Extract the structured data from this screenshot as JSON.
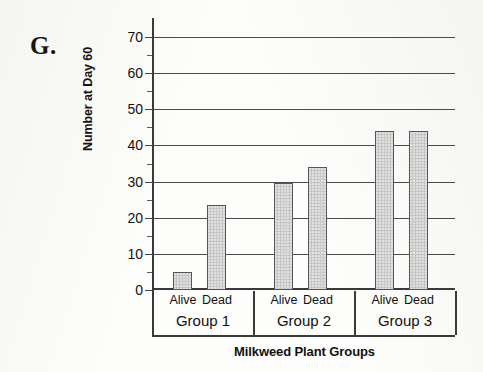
{
  "figure": {
    "letter": "G."
  },
  "chart_data": {
    "type": "bar",
    "title": "",
    "xlabel": "Milkweed Plant Groups",
    "ylabel": "Number at Day 60",
    "ylim": [
      0,
      70
    ],
    "ytick_labels": [
      "0",
      "10",
      "20",
      "30",
      "40",
      "50",
      "60",
      "70"
    ],
    "ytick_values": [
      0,
      10,
      20,
      30,
      40,
      50,
      60,
      70
    ],
    "minor_tick_values": [
      5,
      15,
      25,
      35,
      45,
      55,
      65
    ],
    "grid": "horizontal",
    "legend": "none",
    "categories": [
      "Group 1",
      "Group 2",
      "Group 3"
    ],
    "subcategories": [
      "Alive",
      "Dead"
    ],
    "series": [
      {
        "name": "Alive",
        "values": [
          5,
          29.5,
          44
        ]
      },
      {
        "name": "Dead",
        "values": [
          23.5,
          34,
          44
        ]
      }
    ],
    "bars": [
      {
        "group": "Group 1",
        "subcategory": "Alive",
        "value": 5
      },
      {
        "group": "Group 1",
        "subcategory": "Dead",
        "value": 23.5
      },
      {
        "group": "Group 2",
        "subcategory": "Alive",
        "value": 29.5
      },
      {
        "group": "Group 2",
        "subcategory": "Dead",
        "value": 34
      },
      {
        "group": "Group 3",
        "subcategory": "Alive",
        "value": 44
      },
      {
        "group": "Group 3",
        "subcategory": "Dead",
        "value": 44
      }
    ],
    "colors": {
      "bar_fill": "#c9c9c9",
      "bar_border": "#555555",
      "axis": "#3a3a3a",
      "gridline": "#4b4b4b",
      "text": "#111111",
      "background": "#fdfdfb"
    }
  }
}
